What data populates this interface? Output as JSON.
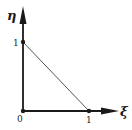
{
  "diagram": {
    "type": "reference-triangle",
    "axes": {
      "x_label": "ξ",
      "y_label": "η"
    },
    "origin_label": "0",
    "x_tick_label": "1",
    "y_tick_label": "1",
    "nodes": [
      {
        "name": "origin",
        "coords": [
          0,
          0
        ]
      },
      {
        "name": "xi-one",
        "coords": [
          1,
          0
        ]
      },
      {
        "name": "eta-one",
        "coords": [
          0,
          1
        ]
      }
    ],
    "edges": [
      {
        "from": "origin",
        "to": "xi-one"
      },
      {
        "from": "origin",
        "to": "eta-one"
      },
      {
        "from": "xi-one",
        "to": "eta-one"
      }
    ],
    "colors": {
      "stroke": "#1a1a1a",
      "hypotenuse": "#555555",
      "background": "#ffffff"
    }
  }
}
